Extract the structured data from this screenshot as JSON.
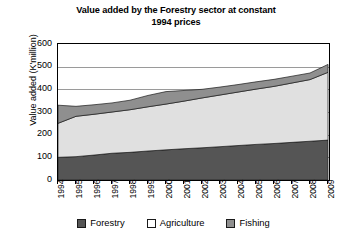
{
  "chart_data": {
    "type": "area",
    "stacked": true,
    "title": "Value added by the Forestry sector at constant 1994 prices",
    "title_line1": "Value added by the Forestry sector at constant",
    "title_line2": "1994 prices",
    "xlabel": "",
    "ylabel": "Value added (K'million)",
    "ylim": [
      0,
      600
    ],
    "yticks": [
      0,
      100,
      200,
      300,
      400,
      500,
      600
    ],
    "grid": true,
    "legend_position": "bottom",
    "categories": [
      "1994",
      "1995",
      "1996",
      "1997",
      "1998",
      "1999",
      "2000",
      "2001",
      "2002",
      "2003",
      "2004",
      "2005",
      "2006",
      "2007",
      "2008",
      "2009"
    ],
    "series": [
      {
        "name": "Forestry",
        "color": "#555555",
        "values": [
          100,
          103,
          110,
          118,
          122,
          128,
          133,
          138,
          142,
          147,
          152,
          157,
          161,
          166,
          171,
          176
        ]
      },
      {
        "name": "Agriculture",
        "color": "#e0e0e0",
        "values": [
          150,
          178,
          180,
          182,
          188,
          195,
          202,
          210,
          220,
          228,
          236,
          244,
          252,
          262,
          272,
          299
        ]
      },
      {
        "name": "Fishing",
        "color": "#8f8f8f",
        "values": [
          80,
          44,
          42,
          40,
          42,
          50,
          55,
          47,
          38,
          35,
          33,
          32,
          31,
          30,
          29,
          35
        ]
      }
    ],
    "totals": [
      330,
      325,
      332,
      340,
      352,
      373,
      390,
      395,
      400,
      410,
      421,
      433,
      444,
      458,
      472,
      510
    ]
  },
  "legend": {
    "items": [
      {
        "label": "Forestry",
        "swatch": "forestry-swatch"
      },
      {
        "label": "Agriculture",
        "swatch": "agriculture-swatch"
      },
      {
        "label": "Fishing",
        "swatch": "fishing-swatch"
      }
    ]
  }
}
